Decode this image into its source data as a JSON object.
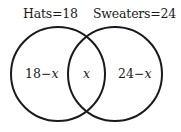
{
  "diagram": {
    "type": "venn",
    "sets": [
      {
        "name": "Hats",
        "total": 18,
        "title": "Hats=18"
      },
      {
        "name": "Sweaters",
        "total": 24,
        "title": "Sweaters=24"
      }
    ],
    "regions": {
      "hats_only": {
        "num": "18",
        "op": "−",
        "var": "x"
      },
      "both": {
        "var": "x"
      },
      "sweaters_only": {
        "num": "24",
        "op": "−",
        "var": "x"
      }
    },
    "colors": {
      "stroke": "#1a1a1a",
      "background": "#ffffff",
      "text": "#1a1a1a"
    }
  }
}
